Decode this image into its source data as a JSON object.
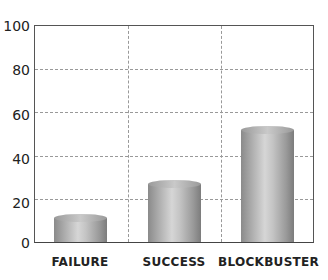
{
  "chart_data": {
    "type": "bar",
    "title": "",
    "xlabel": "",
    "ylabel": "",
    "categories": [
      "FAILURE",
      "SUCCESS",
      "BLOCKBUSTER"
    ],
    "values": [
      11,
      27,
      52
    ],
    "ylim": [
      0,
      100
    ],
    "yticks": [
      "0",
      "20",
      "40",
      "60",
      "80",
      "100"
    ],
    "grid": true,
    "legend": null,
    "style": "3d-cylinder",
    "bar_color": "#b0b0b0"
  }
}
